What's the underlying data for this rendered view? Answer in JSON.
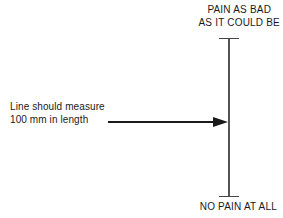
{
  "figure": {
    "background_color": "#ffffff",
    "ink_color": "#1a1a1a"
  },
  "scale": {
    "top_anchor": {
      "line1": "PAIN AS BAD",
      "line2": "AS IT COULD BE"
    },
    "bottom_anchor": {
      "line1": "NO PAIN AT ALL"
    },
    "line": {
      "orientation": "vertical",
      "center_x": 229,
      "top_y": 38,
      "bottom_y": 196,
      "cap_half_width": 10,
      "stroke_color": "#555555",
      "cap_stroke_color": "#444444",
      "stroke_width": 1.2
    }
  },
  "annotation": {
    "line1": "Line should measure",
    "line2": "100 mm in length",
    "arrow": {
      "start_x": 108,
      "end_x": 228,
      "y": 122,
      "stroke_color": "#1a1a1a",
      "stroke_width": 1.1,
      "head_length": 15,
      "head_half_height": 5
    }
  }
}
